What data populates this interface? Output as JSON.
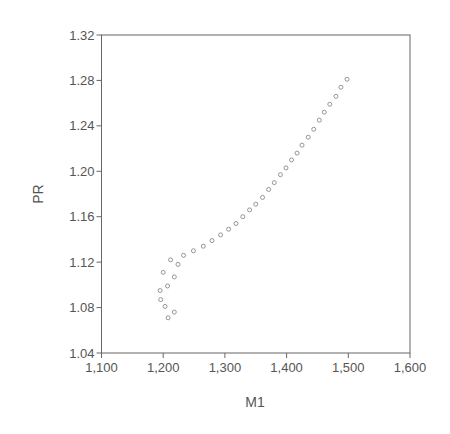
{
  "chart_data": {
    "type": "scatter",
    "title": "",
    "xlabel": "M1",
    "ylabel": "PR",
    "xlim": [
      1100,
      1600
    ],
    "ylim": [
      1.04,
      1.32
    ],
    "xticks": [
      1100,
      1200,
      1300,
      1400,
      1500,
      1600
    ],
    "xtick_labels": [
      "1,100",
      "1,200",
      "1,300",
      "1,400",
      "1,500",
      "1,600"
    ],
    "yticks": [
      1.04,
      1.08,
      1.12,
      1.16,
      1.2,
      1.24,
      1.28,
      1.32
    ],
    "ytick_labels": [
      "1.04",
      "1.08",
      "1.12",
      "1.16",
      "1.20",
      "1.24",
      "1.28",
      "1.32"
    ],
    "grid": false,
    "legend": null,
    "marker": "hollow-circle",
    "series": [
      {
        "name": "PR vs M1",
        "points": [
          {
            "x": 1208,
            "y": 1.071
          },
          {
            "x": 1218,
            "y": 1.076
          },
          {
            "x": 1203,
            "y": 1.081
          },
          {
            "x": 1196,
            "y": 1.087
          },
          {
            "x": 1195,
            "y": 1.095
          },
          {
            "x": 1207,
            "y": 1.099
          },
          {
            "x": 1218,
            "y": 1.107
          },
          {
            "x": 1200,
            "y": 1.111
          },
          {
            "x": 1224,
            "y": 1.118
          },
          {
            "x": 1212,
            "y": 1.122
          },
          {
            "x": 1233,
            "y": 1.126
          },
          {
            "x": 1249,
            "y": 1.13
          },
          {
            "x": 1265,
            "y": 1.134
          },
          {
            "x": 1279,
            "y": 1.139
          },
          {
            "x": 1293,
            "y": 1.144
          },
          {
            "x": 1306,
            "y": 1.149
          },
          {
            "x": 1318,
            "y": 1.154
          },
          {
            "x": 1329,
            "y": 1.16
          },
          {
            "x": 1340,
            "y": 1.166
          },
          {
            "x": 1350,
            "y": 1.171
          },
          {
            "x": 1361,
            "y": 1.177
          },
          {
            "x": 1371,
            "y": 1.184
          },
          {
            "x": 1380,
            "y": 1.19
          },
          {
            "x": 1390,
            "y": 1.197
          },
          {
            "x": 1399,
            "y": 1.203
          },
          {
            "x": 1408,
            "y": 1.21
          },
          {
            "x": 1417,
            "y": 1.216
          },
          {
            "x": 1425,
            "y": 1.223
          },
          {
            "x": 1435,
            "y": 1.23
          },
          {
            "x": 1444,
            "y": 1.237
          },
          {
            "x": 1453,
            "y": 1.245
          },
          {
            "x": 1461,
            "y": 1.252
          },
          {
            "x": 1470,
            "y": 1.259
          },
          {
            "x": 1480,
            "y": 1.266
          },
          {
            "x": 1488,
            "y": 1.274
          },
          {
            "x": 1498,
            "y": 1.281
          }
        ]
      }
    ]
  },
  "style": {
    "axis_color": "#666666",
    "marker_color": "#8a8a8a",
    "text_color": "#555555",
    "background": "#ffffff"
  }
}
